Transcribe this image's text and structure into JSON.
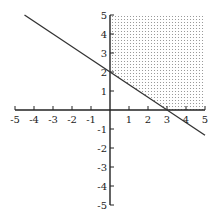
{
  "chart_data": {
    "type": "line",
    "title": "",
    "xlabel": "",
    "ylabel": "",
    "xlim": [
      -5,
      5
    ],
    "ylim": [
      -5,
      5
    ],
    "grid": false,
    "x_ticks": [
      -5,
      -4,
      -3,
      -2,
      -1,
      1,
      2,
      3,
      4,
      5
    ],
    "y_ticks": [
      -5,
      -4,
      -3,
      -2,
      -1,
      1,
      2,
      3,
      4,
      5
    ],
    "series": [
      {
        "name": "boundary line 2x + 3y = 6",
        "x": [
          -4.5,
          5
        ],
        "y": [
          5,
          -1.333
        ],
        "style": "solid"
      }
    ],
    "shaded_region": {
      "description": "dotted region x >= 0, y >= 0, 2x + 3y >= 6",
      "vertices": [
        [
          0,
          2
        ],
        [
          0,
          5
        ],
        [
          5,
          5
        ],
        [
          5,
          0
        ],
        [
          3,
          0
        ]
      ],
      "pattern": "dots"
    },
    "colors": {
      "axis": "#222222",
      "line": "#333333",
      "shade_dot": "#888888"
    }
  }
}
